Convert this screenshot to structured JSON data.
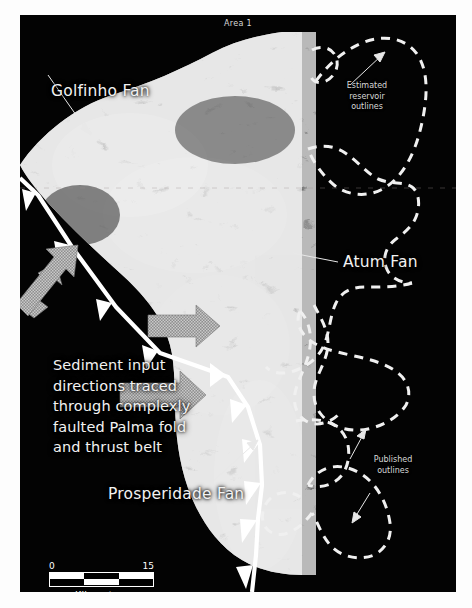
{
  "figure": {
    "title": "Area 1",
    "background_color": "#fdfdfd",
    "panel_color": "#030303",
    "annotation_color": "#f2f2f2",
    "arrow_color": "#9a9a9a"
  },
  "labels": {
    "golfinho_fan": "Golfinho Fan",
    "atum_fan": "Atum Fan",
    "prosperidade_fan": "Prosperidade Fan",
    "estimated_reservoir_outlines": "Estimated\nreservoir\noutlines",
    "estimated_line1": "Estimated",
    "estimated_line2": "reservoir",
    "estimated_line3": "outlines",
    "published_line1": "Published",
    "published_line2": "outlines",
    "paragraph_line1": "Sediment input",
    "paragraph_line2": "directions traced",
    "paragraph_line3": "through complexly",
    "paragraph_line4": "faulted Palma fold",
    "paragraph_line5": "and thrust belt"
  },
  "scale_bar": {
    "min": "0",
    "max": "15",
    "units": "Kilometers"
  },
  "map_features": {
    "thrust_belt_name": "Palma fold and thrust belt",
    "sediment_input_arrow_count": 3,
    "thrust_tooth_count": 9,
    "estimated_outline_count": 2,
    "published_outline_count": 3
  }
}
